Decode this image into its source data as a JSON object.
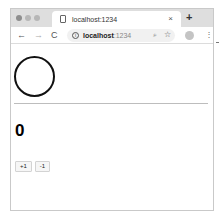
{
  "browser": {
    "tab": {
      "title": "localhost:1234",
      "close_glyph": "×"
    },
    "new_tab_glyph": "+",
    "toolbar": {
      "back_glyph": "←",
      "forward_glyph": "→",
      "reload_glyph": "C",
      "info_glyph": "i",
      "url_host": "localhost",
      "url_port": ":1234",
      "zoom_glyph": "⌕",
      "star_glyph": "☆",
      "menu_glyph": "⋮"
    }
  },
  "page": {
    "counter_value": "0",
    "buttons": [
      {
        "label": "+1"
      },
      {
        "label": "-1"
      }
    ]
  },
  "colors": {
    "tabbar_bg": "#dedede",
    "circle_stroke": "#111111",
    "divider": "#bdbdbd"
  }
}
